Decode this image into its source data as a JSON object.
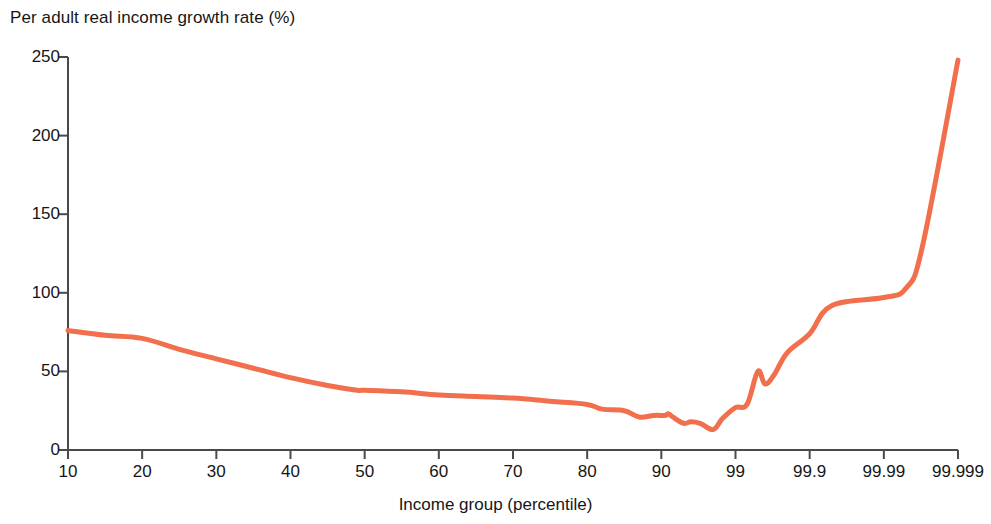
{
  "chart_data": {
    "type": "line",
    "title": "Per adult real income growth rate (%)",
    "xlabel": "Income group (percentile)",
    "ylabel": "Per adult real income growth rate (%)",
    "ylim": [
      0,
      250
    ],
    "yticks": [
      0,
      50,
      100,
      150,
      200,
      250
    ],
    "xtick_labels": [
      "10",
      "20",
      "30",
      "40",
      "50",
      "60",
      "70",
      "80",
      "90",
      "99",
      "99.9",
      "99.99",
      "99.999"
    ],
    "x_scale": "percentile (evenly spaced category positions, log-like tail)",
    "grid": false,
    "legend": null,
    "series": [
      {
        "name": "Per adult real income growth rate",
        "color": "#F26F4D",
        "line_width": 5,
        "points": [
          {
            "x": "10",
            "y": 76
          },
          {
            "x": "15",
            "y": 73
          },
          {
            "x": "20",
            "y": 71
          },
          {
            "x": "25",
            "y": 64
          },
          {
            "x": "30",
            "y": 58
          },
          {
            "x": "35",
            "y": 52
          },
          {
            "x": "40",
            "y": 46
          },
          {
            "x": "45",
            "y": 41
          },
          {
            "x": "49",
            "y": 38
          },
          {
            "x": "50",
            "y": 38
          },
          {
            "x": "55",
            "y": 37
          },
          {
            "x": "60",
            "y": 35
          },
          {
            "x": "65",
            "y": 34
          },
          {
            "x": "70",
            "y": 33
          },
          {
            "x": "75",
            "y": 31
          },
          {
            "x": "80",
            "y": 29
          },
          {
            "x": "82",
            "y": 26
          },
          {
            "x": "85",
            "y": 25
          },
          {
            "x": "87",
            "y": 21
          },
          {
            "x": "89",
            "y": 22
          },
          {
            "x": "91",
            "y": 22
          },
          {
            "x": "92",
            "y": 23
          },
          {
            "x": "93",
            "y": 21
          },
          {
            "x": "95",
            "y": 17
          },
          {
            "x": "96",
            "y": 18
          },
          {
            "x": "97",
            "y": 17
          },
          {
            "x": "98",
            "y": 13
          },
          {
            "x": "98.5",
            "y": 20
          },
          {
            "x": "99",
            "y": 27
          },
          {
            "x": "99.3",
            "y": 29
          },
          {
            "x": "99.5",
            "y": 50
          },
          {
            "x": "99.6",
            "y": 42
          },
          {
            "x": "99.7",
            "y": 48
          },
          {
            "x": "99.8",
            "y": 62
          },
          {
            "x": "99.9",
            "y": 74
          },
          {
            "x": "99.95",
            "y": 92
          },
          {
            "x": "99.99",
            "y": 97
          },
          {
            "x": "99.995",
            "y": 103
          },
          {
            "x": "99.997",
            "y": 130
          },
          {
            "x": "99.999",
            "y": 248
          }
        ]
      }
    ]
  },
  "axis": {
    "y_title": "Per adult real income growth rate (%)",
    "x_title": "Income group (percentile)",
    "y_ticks": [
      {
        "label": "250",
        "value": 250
      },
      {
        "label": "200",
        "value": 200
      },
      {
        "label": "150",
        "value": 150
      },
      {
        "label": "100",
        "value": 100
      },
      {
        "label": "50",
        "value": 50
      },
      {
        "label": "0",
        "value": 0
      }
    ],
    "x_ticks": [
      {
        "label": "10"
      },
      {
        "label": "20"
      },
      {
        "label": "30"
      },
      {
        "label": "40"
      },
      {
        "label": "50"
      },
      {
        "label": "60"
      },
      {
        "label": "70"
      },
      {
        "label": "80"
      },
      {
        "label": "90"
      },
      {
        "label": "99"
      },
      {
        "label": "99.9"
      },
      {
        "label": "99.99"
      },
      {
        "label": "99.999"
      }
    ]
  },
  "style": {
    "line_color": "#F26F4D",
    "axis_color": "#4a4a4a",
    "text_color": "#161616",
    "background": "#ffffff"
  }
}
